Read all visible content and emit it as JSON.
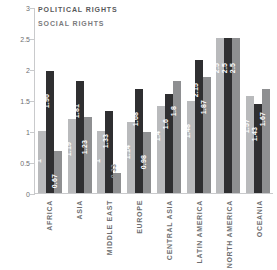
{
  "legend": {
    "items": [
      {
        "label": "POLITICAL RIGHTS",
        "color": "#b9babc"
      },
      {
        "label": "SOCIAL RIGHTS",
        "color": "#8e8f91"
      }
    ]
  },
  "axis": {
    "y_ticks": [
      "0",
      "0.5",
      "1",
      "1.5",
      "2",
      "2.5",
      "3"
    ]
  },
  "chart_data": {
    "type": "bar",
    "title": "",
    "xlabel": "",
    "ylabel": "",
    "ylim": [
      0,
      3
    ],
    "grid": false,
    "legend_position": "top-left",
    "categories": [
      "AFRICA",
      "ASIA",
      "MIDDLE EAST",
      "EUROPE",
      "CENTRAL ASIA",
      "LATIN AMERICA",
      "NORTH AMERICA",
      "OCEANIA"
    ],
    "series": [
      {
        "name": "POLITICAL RIGHTS",
        "color": "#b9babc",
        "values": [
          1,
          1.19,
          1,
          1.14,
          1.4,
          1.48,
          2.5,
          1.57
        ],
        "labels": [
          "1",
          "1.19",
          "1",
          "1.14",
          "1.4",
          "1.48",
          "2.5",
          "1.57"
        ]
      },
      {
        "name": "SERIES-2",
        "color": "#2f2f31",
        "values": [
          1.96,
          1.81,
          1.33,
          1.68,
          1.6,
          2.15,
          2.5,
          1.43
        ],
        "labels": [
          "1.96",
          "1.81",
          "1.33",
          "1.68",
          "1.6",
          "2.15",
          "2.5",
          "1.43"
        ]
      },
      {
        "name": "SOCIAL RIGHTS",
        "color": "#8e8f91",
        "values": [
          0.67,
          1.23,
          0.33,
          0.98,
          1.8,
          1.87,
          2.5,
          1.67
        ],
        "labels": [
          "0.67",
          "1.23",
          "0.33",
          "0.98",
          "1.8",
          "1.87",
          "2.5",
          "1.67"
        ]
      }
    ]
  }
}
